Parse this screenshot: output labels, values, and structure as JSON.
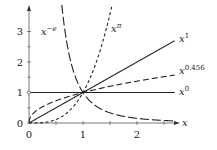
{
  "chart_data": {
    "type": "line",
    "title": "",
    "xlabel": "x",
    "ylabel": "",
    "xlim": [
      0,
      2.7
    ],
    "ylim": [
      0,
      3.6
    ],
    "x_ticks": [
      0,
      1,
      2
    ],
    "x_minor_ticks": [
      0.5,
      1.5,
      2.5
    ],
    "y_ticks": [
      0,
      1,
      2,
      3
    ],
    "y_minor_ticks": [
      0.5,
      1.5,
      2.5
    ],
    "grid": false,
    "series": [
      {
        "name": "x^{-e}",
        "label_base": "x",
        "label_exp": "−e",
        "function": "x^-2.718",
        "style": "long-dashed"
      },
      {
        "name": "x^{π}",
        "label_base": "x",
        "label_exp": "π",
        "function": "x^3.1416",
        "style": "short-dashed"
      },
      {
        "name": "x^{1}",
        "label_base": "x",
        "label_exp": "1",
        "function": "x^1",
        "style": "solid"
      },
      {
        "name": "x^{0.456}",
        "label_base": "x",
        "label_exp": "0.456",
        "function": "x^0.456",
        "style": "dashed"
      },
      {
        "name": "x^{0}",
        "label_base": "x",
        "label_exp": "0",
        "function": "x^0",
        "style": "solid"
      }
    ]
  },
  "axes": {
    "x_label": "x",
    "x_tick_labels": [
      "0",
      "1",
      "2"
    ],
    "y_tick_labels": [
      "0",
      "1",
      "2",
      "3"
    ]
  },
  "labels": {
    "neg_e": {
      "base": "x",
      "exp": "−e"
    },
    "pi": {
      "base": "x",
      "exp": "π"
    },
    "one": {
      "base": "x",
      "exp": "1"
    },
    "p456": {
      "base": "x",
      "exp": "0.456"
    },
    "zero": {
      "base": "x",
      "exp": "0"
    }
  }
}
